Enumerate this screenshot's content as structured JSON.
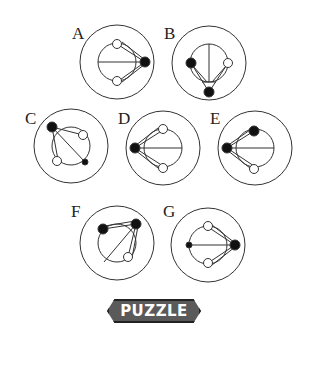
{
  "puzzle": {
    "badge_label": "PUZZLE",
    "badge_number": "21"
  },
  "options": [
    {
      "label": "A",
      "cx": 117,
      "cy": 62,
      "description": "horizontal line, black dot right, white dots top and bottom"
    },
    {
      "label": "B",
      "cx": 209,
      "cy": 63,
      "description": "vertical line, black dots left and bottom, white dot right"
    },
    {
      "label": "C",
      "cx": 71,
      "cy": 146,
      "description": "diagonal line, black dot top-left, small black dot bottom-right, white dots top-right and bottom-left"
    },
    {
      "label": "D",
      "cx": 163,
      "cy": 148,
      "description": "horizontal line, black dot left, white dots top and bottom"
    },
    {
      "label": "E",
      "cx": 255,
      "cy": 148,
      "description": "horizontal line, black dots left and top, white dot bottom"
    },
    {
      "label": "F",
      "cx": 117,
      "cy": 243,
      "description": "diagonal line, black dots top-left and top-right, white dot bottom-right"
    },
    {
      "label": "G",
      "cx": 208,
      "cy": 245,
      "description": "horizontal line, black dot right, small black dot left, white dots top and bottom"
    }
  ]
}
